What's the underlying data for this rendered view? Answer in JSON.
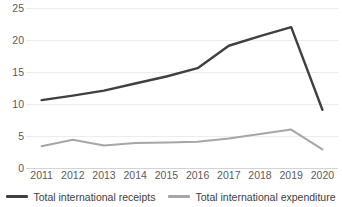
{
  "chart_data": {
    "type": "line",
    "title": "",
    "xlabel": "",
    "ylabel": "",
    "categories": [
      "2011",
      "2012",
      "2013",
      "2014",
      "2015",
      "2016",
      "2017",
      "2018",
      "2019",
      "2020"
    ],
    "series": [
      {
        "name": "Total international receipts",
        "color": "#404040",
        "values": [
          10.6,
          11.3,
          12.1,
          13.2,
          14.3,
          15.6,
          19.1,
          20.6,
          22.0,
          9.1
        ]
      },
      {
        "name": "Total international expenditure",
        "color": "#a6a6a6",
        "values": [
          3.4,
          4.4,
          3.5,
          3.9,
          4.0,
          4.1,
          4.6,
          5.3,
          6.0,
          2.9
        ]
      }
    ],
    "ylim": [
      0,
      25
    ],
    "yticks": [
      0,
      5,
      10,
      15,
      20,
      25
    ],
    "ytick_labels": [
      "0",
      "5",
      "10",
      "15",
      "20",
      "25"
    ],
    "grid": true,
    "legend_position": "bottom"
  },
  "legend": {
    "items": [
      {
        "label": "Total international receipts"
      },
      {
        "label": "Total international expenditure"
      }
    ]
  },
  "colors": {
    "series_dark": "#404040",
    "series_light": "#a6a6a6",
    "gridline": "#ececed",
    "axis_text": "#5b5b5b",
    "background": "#ffffff"
  }
}
